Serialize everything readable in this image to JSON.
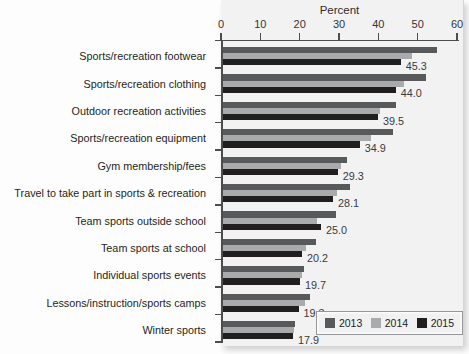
{
  "chart_data": {
    "type": "bar",
    "orientation": "horizontal",
    "xlabel": "Percent",
    "xlim": [
      0,
      60
    ],
    "x_ticks": [
      "0",
      "10",
      "20",
      "30",
      "40",
      "50",
      "60"
    ],
    "grid": false,
    "categories": [
      "Sports/recreation footwear",
      "Sports/recreation clothing",
      "Outdoor recreation activities",
      "Sports/recreation equipment",
      "Gym membership/fees",
      "Travel to take part in sports & recreation",
      "Team sports outside school",
      "Team sports at school",
      "Individual sports events",
      "Lessons/instruction/sports camps",
      "Winter sports"
    ],
    "series": [
      {
        "name": "2013",
        "color": "#58595b",
        "values": [
          54.6,
          51.8,
          44.2,
          43.4,
          31.6,
          32.4,
          28.9,
          23.7,
          20.7,
          22.2,
          18.4
        ]
      },
      {
        "name": "2014",
        "color": "#a8aaac",
        "values": [
          48.1,
          46.2,
          40.1,
          37.8,
          30.0,
          29.1,
          24.0,
          21.2,
          20.2,
          21.0,
          18.1
        ]
      },
      {
        "name": "2015",
        "color": "#211e20",
        "values": [
          45.3,
          44.0,
          39.5,
          34.9,
          29.3,
          28.1,
          25.0,
          20.2,
          19.7,
          19.3,
          17.9
        ]
      }
    ],
    "value_labels": [
      "45.3",
      "44.0",
      "39.5",
      "34.9",
      "29.3",
      "28.1",
      "25.0",
      "20.2",
      "19.7",
      "19.3",
      "17.9"
    ],
    "value_labels_series": "2015",
    "legend": {
      "position": "bottom-right",
      "entries": [
        "2013",
        "2014",
        "2015"
      ]
    }
  }
}
